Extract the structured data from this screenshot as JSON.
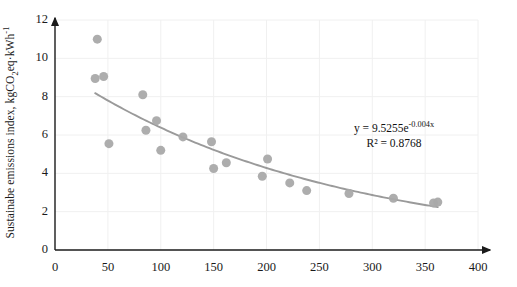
{
  "chart_data": {
    "type": "scatter",
    "title": "",
    "xlabel": "",
    "ylabel": "Sustainabe emissions index, kgCO2eq·kWh-1",
    "ylabel_parts": {
      "prefix": "Sustainabe emissions index, kgCO",
      "sub": "2",
      "mid": "eq·kWh",
      "sup": "-1"
    },
    "xlim": [
      0,
      400
    ],
    "ylim": [
      0,
      12
    ],
    "xticks": [
      0,
      50,
      100,
      150,
      200,
      250,
      300,
      350,
      400
    ],
    "yticks": [
      0,
      2,
      4,
      6,
      8,
      10,
      12
    ],
    "grid": true,
    "grid_color": "#f0f0f0",
    "legend": "none",
    "marker_color": "#a9a9a9",
    "marker_size": 9,
    "trendline": {
      "type": "exponential",
      "equation": "y = 9.5255e",
      "equation_exponent": "-0.004x",
      "r2_label": "R² = 0.8768",
      "coefficient": 9.5255,
      "rate": -0.004,
      "r_squared": 0.8768,
      "color": "#9a9a9a",
      "x_start": 38,
      "x_end": 362
    },
    "points": [
      {
        "x": 40,
        "y": 11.0
      },
      {
        "x": 38,
        "y": 8.95
      },
      {
        "x": 46,
        "y": 9.05
      },
      {
        "x": 51,
        "y": 5.55
      },
      {
        "x": 83,
        "y": 8.1
      },
      {
        "x": 86,
        "y": 6.25
      },
      {
        "x": 96,
        "y": 6.75
      },
      {
        "x": 100,
        "y": 5.2
      },
      {
        "x": 121,
        "y": 5.9
      },
      {
        "x": 148,
        "y": 5.65
      },
      {
        "x": 150,
        "y": 4.25
      },
      {
        "x": 162,
        "y": 4.55
      },
      {
        "x": 196,
        "y": 3.85
      },
      {
        "x": 201,
        "y": 4.75
      },
      {
        "x": 222,
        "y": 3.5
      },
      {
        "x": 238,
        "y": 3.1
      },
      {
        "x": 278,
        "y": 2.95
      },
      {
        "x": 320,
        "y": 2.7
      },
      {
        "x": 358,
        "y": 2.45
      },
      {
        "x": 362,
        "y": 2.5
      }
    ]
  },
  "axis": {
    "x_tick_labels": [
      "0",
      "50",
      "100",
      "150",
      "200",
      "250",
      "300",
      "350",
      "400"
    ],
    "y_tick_labels": [
      "0",
      "2",
      "4",
      "6",
      "8",
      "10",
      "12"
    ],
    "axis_color": "#1a1a1a"
  },
  "annotations": {
    "equation_line1_base": "y = 9.5255e",
    "equation_line1_exp": "-0.004x",
    "equation_line2": "R² = 0.8768"
  }
}
